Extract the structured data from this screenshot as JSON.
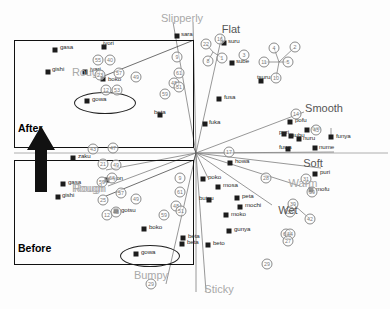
{
  "figure": {
    "title": "",
    "background": "#ffffff",
    "marker_color": "#1c1c1c",
    "axis_label_color": "#a9a9a9",
    "box_color": "#111111"
  },
  "axis_labels": [
    {
      "text": "Slipperly",
      "x": 182,
      "y": 18,
      "dark": false
    },
    {
      "text": "Flat",
      "x": 231,
      "y": 29,
      "dark": true
    },
    {
      "text": "Smooth",
      "x": 324,
      "y": 108,
      "dark": true
    },
    {
      "text": "Soft",
      "x": 313,
      "y": 163,
      "dark": true
    },
    {
      "text": "Warm",
      "x": 303,
      "y": 183,
      "dark": false
    },
    {
      "text": "Wet",
      "x": 288,
      "y": 210,
      "dark": true
    },
    {
      "text": "Sticky",
      "x": 219,
      "y": 289,
      "dark": false
    },
    {
      "text": "Bumpy",
      "x": 151,
      "y": 275,
      "dark": false
    },
    {
      "text": "Rough",
      "x": 90,
      "y": 188,
      "dark": false
    }
  ],
  "boxes": [
    {
      "name": "after-box",
      "label": "After",
      "x": 14,
      "y": 40,
      "w": 180,
      "h": 108,
      "label_x": 18,
      "label_y": 128
    },
    {
      "name": "before-box",
      "label": "Before",
      "x": 14,
      "y": 160,
      "w": 180,
      "h": 105,
      "label_x": 18,
      "label_y": 248
    }
  ],
  "ellipses": [
    {
      "name": "after-gowa-ellipse",
      "x": 74,
      "y": 97,
      "w": 62,
      "h": 22
    },
    {
      "name": "before-gowa-ellipse",
      "x": 122,
      "y": 250,
      "w": 60,
      "h": 22
    }
  ],
  "arrow": {
    "name": "before-to-after-arrow",
    "x": 38,
    "y": 128,
    "w": 22,
    "h": 62
  },
  "chart_data": {
    "type": "scatter",
    "title": "",
    "xlabel": "",
    "ylabel": "",
    "grid": false,
    "legend": "none",
    "note": "MDS-style perceptual map of Japanese texture onomatopoeia with two magnified insets (Before / After)",
    "points": [
      {
        "label": "sara",
        "x": 177,
        "y": 36
      },
      {
        "label": "jyori",
        "x": 104,
        "y": 47
      },
      {
        "label": "gasa",
        "x": 55,
        "y": 50
      },
      {
        "label": "gishi",
        "x": 48,
        "y": 72
      },
      {
        "label": "jyari",
        "x": 85,
        "y": 72
      },
      {
        "label": "boko",
        "x": 103,
        "y": 79
      },
      {
        "label": "gowa",
        "x": 87,
        "y": 101
      },
      {
        "label": "beta",
        "x": 160,
        "y": 115
      },
      {
        "label": "suru",
        "x": 224,
        "y": 43
      },
      {
        "label": "sube",
        "x": 232,
        "y": 63
      },
      {
        "label": "tsuru",
        "x": 261,
        "y": 81
      },
      {
        "label": "fusa",
        "x": 219,
        "y": 99
      },
      {
        "label": "fuka",
        "x": 205,
        "y": 124
      },
      {
        "label": "pofu",
        "x": 290,
        "y": 122
      },
      {
        "label": "furi",
        "x": 307,
        "y": 130
      },
      {
        "label": "puri",
        "x": 284,
        "y": 134
      },
      {
        "label": "tsubu",
        "x": 291,
        "y": 136
      },
      {
        "label": "nuru",
        "x": 299,
        "y": 139
      },
      {
        "label": "funya",
        "x": 331,
        "y": 137
      },
      {
        "label": "fuwa",
        "x": 288,
        "y": 149
      },
      {
        "label": "nume",
        "x": 315,
        "y": 148
      },
      {
        "label": "howa",
        "x": 230,
        "y": 163
      },
      {
        "label": "puri2",
        "x": 315,
        "y": 174
      },
      {
        "label": "mofu",
        "x": 311,
        "y": 190
      },
      {
        "label": "poko",
        "x": 203,
        "y": 179
      },
      {
        "label": "mosa",
        "x": 218,
        "y": 187
      },
      {
        "label": "butsu",
        "x": 209,
        "y": 200
      },
      {
        "label": "peta",
        "x": 237,
        "y": 198
      },
      {
        "label": "mochi",
        "x": 240,
        "y": 207
      },
      {
        "label": "moko",
        "x": 226,
        "y": 215
      },
      {
        "label": "gunya",
        "x": 229,
        "y": 231
      },
      {
        "label": "beto",
        "x": 208,
        "y": 245
      },
      {
        "label": "beta2",
        "x": 183,
        "y": 238
      },
      {
        "label": "zaku",
        "x": 73,
        "y": 158
      },
      {
        "label": "gasa2",
        "x": 63,
        "y": 184
      },
      {
        "label": "gishi2",
        "x": 58,
        "y": 197
      },
      {
        "label": "lyon",
        "x": 107,
        "y": 180
      },
      {
        "label": "gotsu",
        "x": 116,
        "y": 211
      },
      {
        "label": "boko2",
        "x": 144,
        "y": 229
      },
      {
        "label": "beta3",
        "x": 182,
        "y": 244
      },
      {
        "label": "gowa2",
        "x": 136,
        "y": 254
      }
    ],
    "point_texts": [
      {
        "text": "sara",
        "x": 181,
        "y": 33
      },
      {
        "text": "jyori",
        "x": 103,
        "y": 42
      },
      {
        "text": "gasa",
        "x": 60,
        "y": 46
      },
      {
        "text": "gishi",
        "x": 52,
        "y": 68
      },
      {
        "text": "jyari",
        "x": 90,
        "y": 68
      },
      {
        "text": "boko",
        "x": 108,
        "y": 78
      },
      {
        "text": "gowa",
        "x": 92,
        "y": 98
      },
      {
        "text": "beta",
        "x": 154,
        "y": 111
      },
      {
        "text": "suru",
        "x": 228,
        "y": 40
      },
      {
        "text": "sube",
        "x": 236,
        "y": 60
      },
      {
        "text": "tsuru",
        "x": 257,
        "y": 76
      },
      {
        "text": "fusa",
        "x": 224,
        "y": 96
      },
      {
        "text": "fuka",
        "x": 209,
        "y": 121
      },
      {
        "text": "pofu",
        "x": 295,
        "y": 119
      },
      {
        "text": "furi",
        "x": 312,
        "y": 127
      },
      {
        "text": "puri",
        "x": 279,
        "y": 131
      },
      {
        "text": "tsubu",
        "x": 290,
        "y": 134
      },
      {
        "text": "nuru",
        "x": 303,
        "y": 137
      },
      {
        "text": "funya",
        "x": 336,
        "y": 135
      },
      {
        "text": "fuwa",
        "x": 279,
        "y": 146
      },
      {
        "text": "nume",
        "x": 319,
        "y": 146
      },
      {
        "text": "howa",
        "x": 235,
        "y": 160
      },
      {
        "text": "puri",
        "x": 320,
        "y": 171
      },
      {
        "text": "mofu",
        "x": 316,
        "y": 188
      },
      {
        "text": "poko",
        "x": 208,
        "y": 176
      },
      {
        "text": "mosa",
        "x": 223,
        "y": 184
      },
      {
        "text": "butsu",
        "x": 199,
        "y": 197
      },
      {
        "text": "peta",
        "x": 242,
        "y": 195
      },
      {
        "text": "mochi",
        "x": 245,
        "y": 204
      },
      {
        "text": "moko",
        "x": 231,
        "y": 213
      },
      {
        "text": "gunya",
        "x": 234,
        "y": 228
      },
      {
        "text": "beto",
        "x": 213,
        "y": 242
      },
      {
        "text": "beta",
        "x": 188,
        "y": 235
      },
      {
        "text": "zaku",
        "x": 78,
        "y": 155
      },
      {
        "text": "gasa",
        "x": 68,
        "y": 181
      },
      {
        "text": "gishi",
        "x": 62,
        "y": 194
      },
      {
        "text": "lyon",
        "x": 112,
        "y": 177
      },
      {
        "text": "gotsu",
        "x": 121,
        "y": 209
      },
      {
        "text": "boko",
        "x": 149,
        "y": 226
      },
      {
        "text": "beta",
        "x": 187,
        "y": 241
      },
      {
        "text": "gowa",
        "x": 141,
        "y": 251
      },
      {
        "text": "Rough",
        "x": 72,
        "y": 72
      },
      {
        "text": "Rough",
        "x": 72,
        "y": 188
      }
    ],
    "numbered_markers": [
      {
        "n": "9",
        "x": 177,
        "y": 57
      },
      {
        "n": "61",
        "x": 179,
        "y": 73
      },
      {
        "n": "57",
        "x": 119,
        "y": 73
      },
      {
        "n": "49",
        "x": 136,
        "y": 77
      },
      {
        "n": "55",
        "x": 98,
        "y": 60
      },
      {
        "n": "40",
        "x": 110,
        "y": 60
      },
      {
        "n": "23",
        "x": 100,
        "y": 75
      },
      {
        "n": "12",
        "x": 106,
        "y": 90
      },
      {
        "n": "53",
        "x": 117,
        "y": 90
      },
      {
        "n": "48",
        "x": 174,
        "y": 83
      },
      {
        "n": "51",
        "x": 179,
        "y": 87
      },
      {
        "n": "59",
        "x": 165,
        "y": 94
      },
      {
        "n": "16",
        "x": 220,
        "y": 39
      },
      {
        "n": "22",
        "x": 206,
        "y": 44
      },
      {
        "n": "1",
        "x": 222,
        "y": 58
      },
      {
        "n": "3",
        "x": 244,
        "y": 55
      },
      {
        "n": "8",
        "x": 208,
        "y": 61
      },
      {
        "n": "4",
        "x": 274,
        "y": 48
      },
      {
        "n": "2",
        "x": 295,
        "y": 47
      },
      {
        "n": "11",
        "x": 264,
        "y": 62
      },
      {
        "n": "5",
        "x": 288,
        "y": 62
      },
      {
        "n": "10",
        "x": 276,
        "y": 78
      },
      {
        "n": "14",
        "x": 296,
        "y": 114
      },
      {
        "n": "43",
        "x": 316,
        "y": 130
      },
      {
        "n": "17",
        "x": 229,
        "y": 152
      },
      {
        "n": "43",
        "x": 93,
        "y": 149
      },
      {
        "n": "47",
        "x": 113,
        "y": 148
      },
      {
        "n": "21",
        "x": 103,
        "y": 164
      },
      {
        "n": "49",
        "x": 116,
        "y": 165
      },
      {
        "n": "59",
        "x": 102,
        "y": 182
      },
      {
        "n": "64",
        "x": 112,
        "y": 178
      },
      {
        "n": "57",
        "x": 121,
        "y": 193
      },
      {
        "n": "25",
        "x": 103,
        "y": 200
      },
      {
        "n": "49",
        "x": 136,
        "y": 199
      },
      {
        "n": "12",
        "x": 107,
        "y": 215
      },
      {
        "n": "48",
        "x": 116,
        "y": 212
      },
      {
        "n": "9",
        "x": 180,
        "y": 178
      },
      {
        "n": "61",
        "x": 180,
        "y": 192
      },
      {
        "n": "48",
        "x": 176,
        "y": 206
      },
      {
        "n": "51",
        "x": 181,
        "y": 211
      },
      {
        "n": "59",
        "x": 164,
        "y": 215
      },
      {
        "n": "28",
        "x": 266,
        "y": 178
      },
      {
        "n": "31",
        "x": 306,
        "y": 179
      },
      {
        "n": "59",
        "x": 312,
        "y": 192
      },
      {
        "n": "39",
        "x": 293,
        "y": 204
      },
      {
        "n": "38",
        "x": 290,
        "y": 212
      },
      {
        "n": "42",
        "x": 310,
        "y": 219
      },
      {
        "n": "60",
        "x": 286,
        "y": 234
      },
      {
        "n": "44",
        "x": 290,
        "y": 234
      },
      {
        "n": "27",
        "x": 288,
        "y": 241
      },
      {
        "n": "29",
        "x": 267,
        "y": 264
      },
      {
        "n": "29",
        "x": 151,
        "y": 284
      }
    ]
  }
}
